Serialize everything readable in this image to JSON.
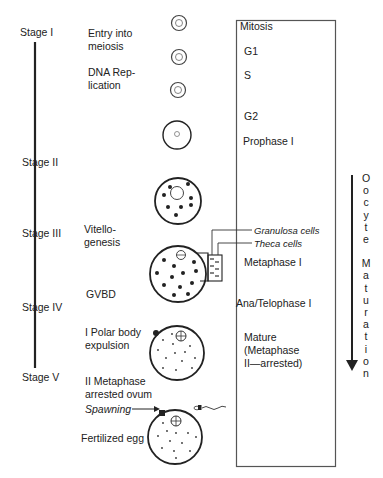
{
  "stages": [
    {
      "label": "Stage I",
      "x": 20,
      "y": 26
    },
    {
      "label": "Stage II",
      "x": 22,
      "y": 156
    },
    {
      "label": "Stage III",
      "x": 22,
      "y": 227
    },
    {
      "label": "Stage IV",
      "x": 22,
      "y": 301
    },
    {
      "label": "Stage V",
      "x": 22,
      "y": 371
    }
  ],
  "events": [
    {
      "line1": "Entry into",
      "line2": "meiosis",
      "x": 88,
      "y": 27
    },
    {
      "line1": "DNA Rep-",
      "line2": "lication",
      "x": 88,
      "y": 66
    },
    {
      "line1": "Vitello-",
      "line2": "genesis",
      "x": 84,
      "y": 223
    },
    {
      "line1": "GVBD",
      "line2": "",
      "x": 86,
      "y": 288
    },
    {
      "line1": "I Polar body",
      "line2": "expulsion",
      "x": 85,
      "y": 326
    },
    {
      "line1": "II Metaphase",
      "line2": "arrested ovum",
      "x": 85,
      "y": 375
    },
    {
      "line1": "Fertilized egg",
      "line2": "",
      "x": 81,
      "y": 432
    }
  ],
  "spawning_label": "Spawning",
  "phase_box": {
    "title": "Mitosis",
    "phases": [
      {
        "label": "G1",
        "y": 45
      },
      {
        "label": "S",
        "y": 69
      },
      {
        "label": "G2",
        "y": 110
      },
      {
        "label": "Prophase I",
        "y": 135
      },
      {
        "label": "Metaphase I",
        "y": 256
      },
      {
        "label": "Ana/Telophase I",
        "y": 297
      },
      {
        "label": "Mature",
        "y": 331
      },
      {
        "label": "(Metaphase",
        "y": 344
      },
      {
        "label": "II—arrested)",
        "y": 357
      }
    ]
  },
  "follicle_labels": {
    "granulosa": "Granulosa cells",
    "theca": "Theca cells"
  },
  "maturation_arrow": {
    "letters": [
      "O",
      "o",
      "c",
      "y",
      "t",
      "e",
      " ",
      "M",
      "a",
      "t",
      "u",
      "r",
      "a",
      "t",
      "i",
      "o",
      "n"
    ],
    "label": "Oocyte Maturation"
  },
  "colors": {
    "ink": "#222222",
    "box": "#555555"
  }
}
